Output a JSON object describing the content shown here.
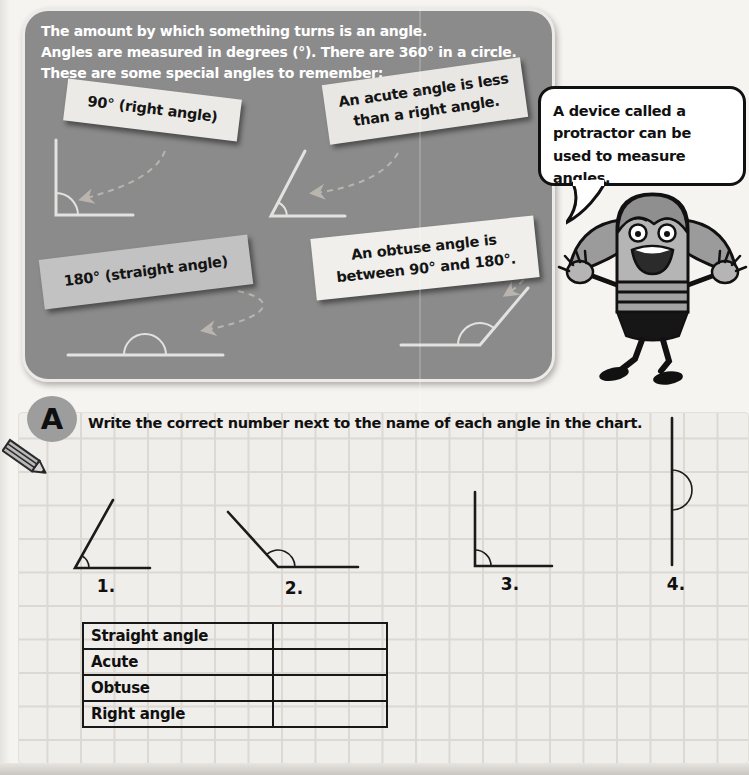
{
  "colors": {
    "panel_bg": "#8b8b8b",
    "panel_text": "#ffffff",
    "card_bg": "#eceae7",
    "card_dark_bg": "#c2c2c2",
    "ink": "#1b1b1b",
    "page_bg": "#f6f4f1",
    "grid_bg": "#f0eeea",
    "grid_line": "#dcd8d2",
    "badge_bg": "#9d9d9d",
    "diagram_light": "#e2e2e0",
    "arrow": "#c9c4ba"
  },
  "intro_panel": {
    "lines": [
      "The amount by which something turns is an angle.",
      "Angles are measured in degrees (°). There are 360° in a circle.",
      "These are some special angles to remember:"
    ],
    "cards": [
      {
        "id": "right-angle",
        "lines": [
          "90° (right angle)"
        ]
      },
      {
        "id": "acute-angle",
        "lines": [
          "An acute angle is less",
          "than a right angle."
        ]
      },
      {
        "id": "straight-angle",
        "lines": [
          "180° (straight angle)"
        ]
      },
      {
        "id": "obtuse-angle",
        "lines": [
          "An obtuse angle is",
          "between 90° and 180°."
        ]
      }
    ]
  },
  "speech_bubble": {
    "text": "A device called a protractor can be used to measure angles.",
    "mascot_icon": "pencil-girl-character"
  },
  "exercise": {
    "badge_label": "A",
    "pencil_icon": "pencil-icon",
    "instruction": "Write the correct number next to the name of each angle in the chart.",
    "figures": [
      {
        "label": "1.",
        "type": "acute"
      },
      {
        "label": "2.",
        "type": "obtuse"
      },
      {
        "label": "3.",
        "type": "right"
      },
      {
        "label": "4.",
        "type": "straight"
      }
    ],
    "table": {
      "rows": [
        {
          "label": "Straight angle",
          "answer": ""
        },
        {
          "label": "Acute",
          "answer": ""
        },
        {
          "label": "Obtuse",
          "answer": ""
        },
        {
          "label": "Right angle",
          "answer": ""
        }
      ]
    }
  }
}
